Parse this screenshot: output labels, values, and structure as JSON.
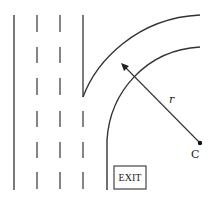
{
  "diagram": {
    "type": "highway-exit-ramp",
    "labels": {
      "radius": "r",
      "center": "C",
      "exit_sign": "EXIT"
    },
    "colors": {
      "line": "#333333",
      "background": "#ffffff"
    },
    "lanes": {
      "left_edge_x": 14,
      "dashed_dividers_x": [
        37,
        60
      ],
      "right_edge_x": 83
    }
  }
}
